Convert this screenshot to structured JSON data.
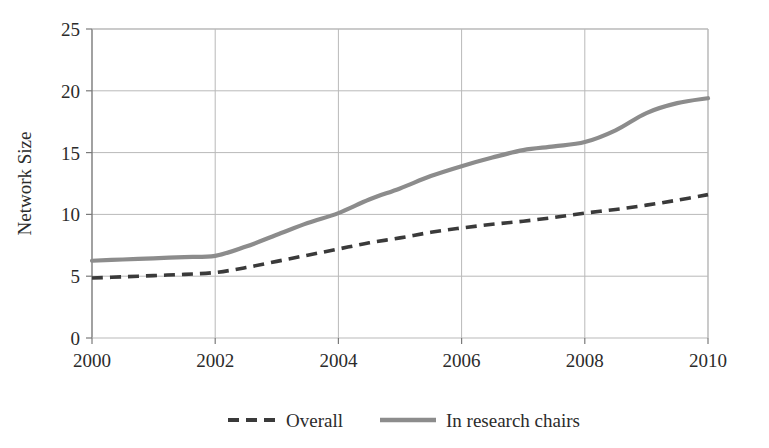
{
  "figure": {
    "background": "#ffffff",
    "axis_color": "#7a7a7a",
    "grid_color": "#b9b9b9"
  },
  "axes": {
    "y_title": "Network Size",
    "x_title": ""
  },
  "legend": {
    "position": "bottom",
    "entries": [
      {
        "label": "Overall",
        "color": "#3a3a3a",
        "style": "dashed"
      },
      {
        "label": "In research chairs",
        "color": "#8c8c8c",
        "style": "solid"
      }
    ]
  },
  "chart_data": {
    "type": "line",
    "title": "",
    "xlabel": "",
    "ylabel": "Network Size",
    "xlim": [
      2000,
      2010
    ],
    "ylim": [
      0,
      25
    ],
    "grid": true,
    "legend_position": "bottom",
    "x_ticks": [
      2000,
      2002,
      2004,
      2006,
      2008,
      2010
    ],
    "y_ticks": [
      0,
      5,
      10,
      15,
      20,
      25
    ],
    "x": [
      2000,
      2000.5,
      2001,
      2001.5,
      2002,
      2002.5,
      2003,
      2003.5,
      2004,
      2004.5,
      2005,
      2005.5,
      2006,
      2006.5,
      2007,
      2007.5,
      2008,
      2008.5,
      2009,
      2009.5,
      2010
    ],
    "series": [
      {
        "name": "Overall",
        "color": "#3a3a3a",
        "style": "dashed",
        "values": [
          4.85,
          4.95,
          5.05,
          5.15,
          5.3,
          5.7,
          6.2,
          6.7,
          7.2,
          7.7,
          8.1,
          8.55,
          8.9,
          9.2,
          9.45,
          9.75,
          10.1,
          10.4,
          10.75,
          11.15,
          11.6
        ]
      },
      {
        "name": "In research chairs",
        "color": "#8c8c8c",
        "style": "solid",
        "values": [
          6.25,
          6.35,
          6.45,
          6.55,
          6.65,
          7.4,
          8.35,
          9.3,
          10.1,
          11.2,
          12.1,
          13.1,
          13.9,
          14.6,
          15.2,
          15.5,
          15.85,
          16.8,
          18.2,
          19.0,
          19.4
        ]
      }
    ]
  }
}
